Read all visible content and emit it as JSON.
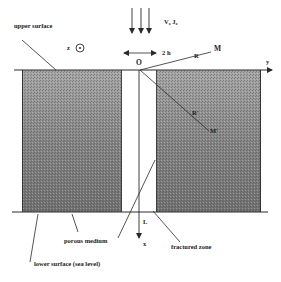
{
  "labels": {
    "upper_surface": "upper surface",
    "lower_surface": "lower surface (sea level)",
    "porous_medium": "porous medium",
    "fractured_zone": "fractured zone",
    "z_axis": "z",
    "y_axis": "y",
    "x_axis": "x",
    "origin": "O",
    "flux": "V₀  J₀",
    "width": "2 h",
    "R": "R",
    "M": "M",
    "R_prime": "R'",
    "M_prime": "M'",
    "L": "L"
  },
  "caption": "FIG. 1.  Schematic of the fractured zone geometry",
  "colors": {
    "block_fill_dark": "#6e6e6e",
    "block_fill_light": "#9a9a9a",
    "line": "#2a2a2a",
    "background": "#ffffff"
  }
}
